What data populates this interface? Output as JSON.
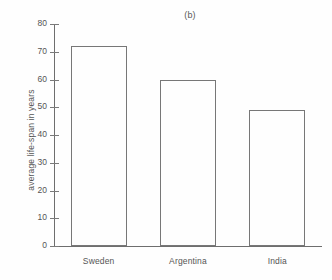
{
  "chart_data": {
    "type": "bar",
    "title": "(b)",
    "xlabel": "",
    "ylabel": "average life-span in years",
    "categories": [
      "Sweden",
      "Argentina",
      "India"
    ],
    "values": [
      72,
      60,
      49
    ],
    "ylim": [
      0,
      80
    ],
    "ytick_labels": [
      "0",
      "10",
      "20",
      "30",
      "40",
      "50",
      "60",
      "70",
      "80"
    ],
    "ytick_values": [
      0,
      10,
      20,
      30,
      40,
      50,
      60,
      70,
      80
    ],
    "grid": false,
    "legend": null,
    "bar_fill_color": "#fefefe",
    "bar_edge_color": "#777777",
    "axis_color": "#6e6e6e",
    "text_color": "#555555",
    "background_color": "#fefefe"
  }
}
